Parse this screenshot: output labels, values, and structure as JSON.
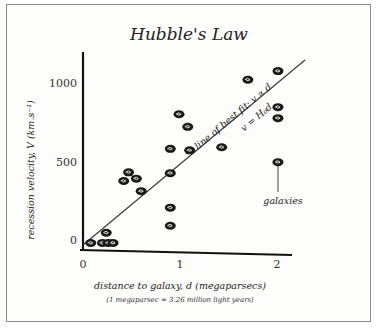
{
  "chart_data": {
    "type": "scatter",
    "title": "Hubble's Law",
    "xlabel": "distance to galaxy, d (megaparsecs)",
    "xlabel_note": "(1 megaparsec = 3.26 million light years)",
    "ylabel": "recession velocity, V (km.s⁻¹)",
    "xticks": [
      "0",
      "1",
      "2"
    ],
    "yticks": [
      "0",
      "500",
      "1000"
    ],
    "xlim": [
      0,
      2.1
    ],
    "ylim": [
      0,
      1100
    ],
    "grid": false,
    "series": [
      {
        "name": "galaxies",
        "points": [
          {
            "x": 0.08,
            "y": 0
          },
          {
            "x": 0.2,
            "y": 0
          },
          {
            "x": 0.26,
            "y": 0
          },
          {
            "x": 0.31,
            "y": 0
          },
          {
            "x": 0.24,
            "y": 65
          },
          {
            "x": 0.42,
            "y": 395
          },
          {
            "x": 0.47,
            "y": 450
          },
          {
            "x": 0.55,
            "y": 410
          },
          {
            "x": 0.6,
            "y": 330
          },
          {
            "x": 0.9,
            "y": 110
          },
          {
            "x": 0.9,
            "y": 225
          },
          {
            "x": 0.9,
            "y": 445
          },
          {
            "x": 0.9,
            "y": 600
          },
          {
            "x": 0.99,
            "y": 820
          },
          {
            "x": 1.08,
            "y": 740
          },
          {
            "x": 1.1,
            "y": 590
          },
          {
            "x": 1.43,
            "y": 610
          },
          {
            "x": 1.7,
            "y": 1040
          },
          {
            "x": 2.01,
            "y": 1095
          },
          {
            "x": 2.01,
            "y": 865
          },
          {
            "x": 2.01,
            "y": 795
          },
          {
            "x": 2.01,
            "y": 515
          }
        ]
      },
      {
        "name": "line of best fit",
        "type": "line",
        "x": [
          0,
          2.3
        ],
        "y": [
          0,
          1180
        ]
      }
    ],
    "annotations": [
      "line of best fit: v ∝ d",
      "v = H₀d",
      "galaxies"
    ]
  }
}
